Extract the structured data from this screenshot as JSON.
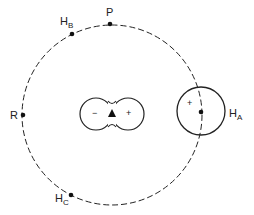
{
  "diagram": {
    "colors": {
      "stroke": "#222222",
      "background": "#ffffff"
    },
    "orbit": {
      "style": "dashed",
      "cx": 112,
      "cy": 115,
      "r": 90
    },
    "points": [
      {
        "id": "P",
        "label": "P",
        "sub": "",
        "x": 110,
        "y": 24
      },
      {
        "id": "HB",
        "label": "H",
        "sub": "B",
        "x": 72,
        "y": 34
      },
      {
        "id": "R",
        "label": "R",
        "sub": "",
        "x": 23,
        "y": 115
      },
      {
        "id": "HC",
        "label": "H",
        "sub": "C",
        "x": 71,
        "y": 195
      },
      {
        "id": "HA",
        "label": "H",
        "sub": "A",
        "x": 201,
        "y": 112
      }
    ],
    "dipole": {
      "left_lobe_sign": "−",
      "right_lobe_sign": "+",
      "center_marker": "triangle"
    },
    "ha_circle": {
      "sign": "+"
    }
  }
}
